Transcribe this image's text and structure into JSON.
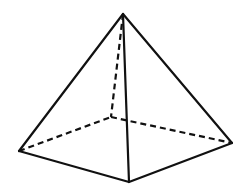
{
  "diagram": {
    "type": "square-pyramid",
    "stroke_color": "#111111",
    "background": "#ffffff",
    "vertices": {
      "apex": [
        123,
        14
      ],
      "left": [
        19,
        151
      ],
      "front": [
        129,
        182
      ],
      "right": [
        232,
        143
      ],
      "back": [
        111,
        117
      ]
    },
    "visible_edges": [
      [
        "apex",
        "left"
      ],
      [
        "apex",
        "front"
      ],
      [
        "apex",
        "right"
      ],
      [
        "left",
        "front"
      ],
      [
        "front",
        "right"
      ]
    ],
    "hidden_edges": [
      [
        "apex",
        "back"
      ],
      [
        "left",
        "back"
      ],
      [
        "back",
        "right"
      ]
    ]
  }
}
